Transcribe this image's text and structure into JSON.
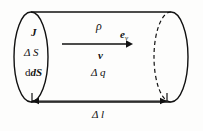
{
  "figure": {
    "background_color": "#fdfdfc",
    "line_color": "#111111",
    "labels": {
      "current_density": "J",
      "area_element_macro": "Δ S",
      "area_element_differential": "dS",
      "charge_density": "ρ",
      "velocity_unit_vector": "e",
      "velocity_unit_vector_subscript": "v",
      "velocity": "v",
      "charge_element": "Δ q",
      "length_element": "Δ l"
    },
    "geometry": {
      "left_ellipse_center_x": 31,
      "left_ellipse_center_y": 57,
      "left_ellipse_rx": 17,
      "left_ellipse_ry": 45,
      "right_ellipse_center_x": 171,
      "right_ellipse_center_y": 57,
      "right_ellipse_rx": 17,
      "right_ellipse_ry": 45,
      "arrow_start_x": 62,
      "arrow_end_x": 131,
      "arrow_y": 44,
      "dimension_line_y": 101,
      "dimension_left_x": 32,
      "dimension_right_x": 167
    }
  }
}
